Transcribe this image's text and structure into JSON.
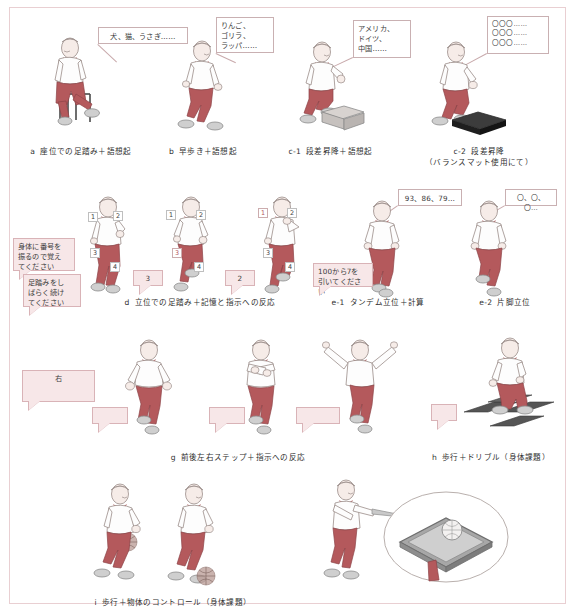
{
  "figure": {
    "border_color": "#e9cfd2",
    "bubble_fill": "#f7e7e8",
    "bubble_stroke": "#d9b3b7",
    "skin_color": "#f0e6e2",
    "shirt_color": "#fdfdfd",
    "pants_color": "#b4595c",
    "shoe_color": "#c9c9c9",
    "mat_color": "#2b2b2b",
    "arrow_color": "#000000"
  },
  "items": [
    {
      "id": "a",
      "key": "a",
      "caption": "座位での足踏み＋語想起",
      "bubbles": [
        {
          "name": "speech-bubble-a",
          "text": "犬、猫、うさぎ……",
          "style": "plain"
        }
      ]
    },
    {
      "id": "b",
      "key": "b",
      "caption": "早歩き＋語想起",
      "bubbles": [
        {
          "name": "speech-bubble-b",
          "text": "りんご、\nゴリラ、\nラッパ……",
          "style": "plain"
        }
      ]
    },
    {
      "id": "c1",
      "key": "c-1",
      "caption": "段差昇降＋語想起",
      "bubbles": [
        {
          "name": "speech-bubble-c1",
          "text": "アメリカ、\nドイツ、\n中国……",
          "style": "plain"
        }
      ]
    },
    {
      "id": "c2",
      "key": "c-2",
      "caption": "段差昇降\n（バランスマット使用にて）",
      "bubbles": [
        {
          "name": "speech-bubble-c2",
          "text": "〇〇〇……\n〇〇〇……\n〇〇〇……",
          "style": "plain"
        }
      ]
    },
    {
      "id": "d",
      "key": "d",
      "caption": "立位での足踏み＋記憶と指示への反応",
      "bubbles": [
        {
          "name": "instruction-bubble-d-1",
          "text": "身体に番号を\n振るので覚え\nてください",
          "style": "pink"
        },
        {
          "name": "instruction-bubble-d-2",
          "text": "足踏みをし\nばらく続け\nてください",
          "style": "pink"
        },
        {
          "name": "cue-bubble-d-3",
          "text": "3",
          "style": "pink"
        },
        {
          "name": "cue-bubble-d-2",
          "text": "2",
          "style": "pink"
        }
      ],
      "body_number_tags": [
        "1",
        "2",
        "3",
        "4"
      ]
    },
    {
      "id": "e1",
      "key": "e-1",
      "caption": "タンデム立位＋計算",
      "bubbles": [
        {
          "name": "speech-bubble-e1-count",
          "text": "93、86、79…",
          "style": "plain"
        },
        {
          "name": "instruction-bubble-e1",
          "text": "100から7を\n引いてください",
          "style": "pink"
        }
      ]
    },
    {
      "id": "e2",
      "key": "e-2",
      "caption": "片脚立位",
      "bubbles": [
        {
          "name": "speech-bubble-e2",
          "text": "〇、〇、〇…",
          "style": "plain"
        }
      ]
    },
    {
      "id": "f",
      "key": "f",
      "caption": "足踏み＋じゃんけん",
      "bubbles": [
        {
          "name": "instruction-bubble-f",
          "text": "足踏みしながら、\nじゃんけんに負け\nてください",
          "style": "pink"
        },
        {
          "name": "cue-bubble-f-paa",
          "text": "パー",
          "style": "pink"
        },
        {
          "name": "cue-bubble-f-guu",
          "text": "グー",
          "style": "pink"
        },
        {
          "name": "cue-bubble-f-choki",
          "text": "チョキ",
          "style": "pink"
        }
      ]
    },
    {
      "id": "g",
      "key": "g",
      "caption": "前後左右ステップ＋指示への反応",
      "bubbles": [
        {
          "name": "cue-bubble-g",
          "text": "右",
          "style": "pink"
        }
      ]
    },
    {
      "id": "h",
      "key": "h",
      "caption": "歩行＋ドリブル（身体課題）",
      "bubbles": []
    },
    {
      "id": "i",
      "key": "i",
      "caption": "歩行＋物体のコントロール（身体課題）",
      "bubbles": []
    }
  ]
}
